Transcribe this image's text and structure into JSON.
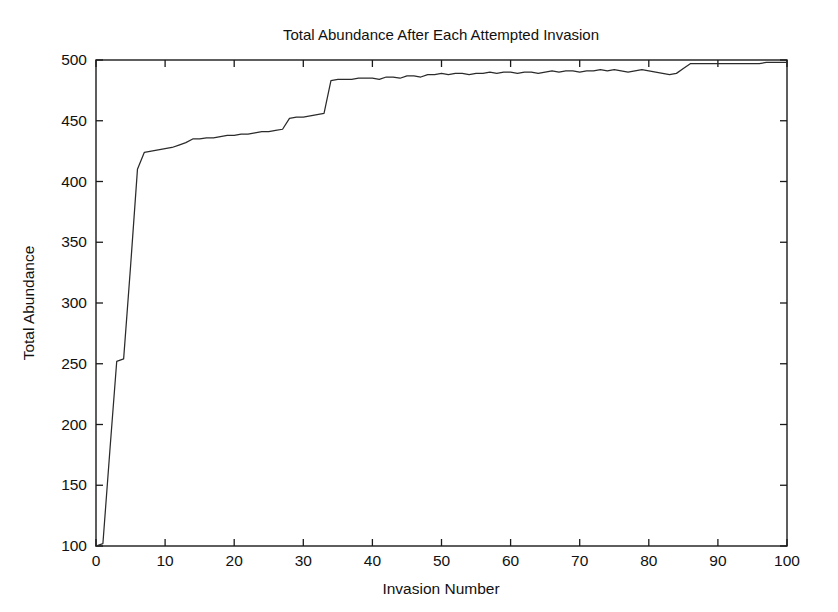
{
  "chart_data": {
    "type": "line",
    "title": "Total Abundance After Each Attempted Invasion",
    "xlabel": "Invasion Number",
    "ylabel": "Total Abundance",
    "xlim": [
      0,
      100
    ],
    "ylim": [
      100,
      500
    ],
    "xticks": [
      0,
      10,
      20,
      30,
      40,
      50,
      60,
      70,
      80,
      90,
      100
    ],
    "yticks": [
      100,
      150,
      200,
      250,
      300,
      350,
      400,
      450,
      500
    ],
    "grid": false,
    "legend": null,
    "line_color": "#2b2b2b",
    "background": "#ffffff",
    "series": [
      {
        "name": "Total Abundance",
        "x": [
          0,
          1,
          2,
          3,
          4,
          5,
          6,
          7,
          8,
          9,
          10,
          11,
          12,
          13,
          14,
          15,
          16,
          17,
          18,
          19,
          20,
          21,
          22,
          23,
          24,
          25,
          26,
          27,
          28,
          29,
          30,
          31,
          32,
          33,
          34,
          35,
          36,
          37,
          38,
          39,
          40,
          41,
          42,
          43,
          44,
          45,
          46,
          47,
          48,
          49,
          50,
          51,
          52,
          53,
          54,
          55,
          56,
          57,
          58,
          59,
          60,
          61,
          62,
          63,
          64,
          65,
          66,
          67,
          68,
          69,
          70,
          71,
          72,
          73,
          74,
          75,
          76,
          77,
          78,
          79,
          80,
          81,
          82,
          83,
          84,
          85,
          86,
          87,
          88,
          89,
          90,
          91,
          92,
          93,
          94,
          95,
          96,
          97,
          98,
          99,
          100
        ],
        "values": [
          100,
          102,
          178,
          252,
          254,
          330,
          410,
          424,
          425,
          426,
          427,
          428,
          430,
          432,
          435,
          435,
          436,
          436,
          437,
          438,
          438,
          439,
          439,
          440,
          441,
          441,
          442,
          443,
          452,
          453,
          453,
          454,
          455,
          456,
          483,
          484,
          484,
          484,
          485,
          485,
          485,
          484,
          486,
          486,
          485,
          487,
          487,
          486,
          488,
          488,
          489,
          488,
          489,
          489,
          488,
          489,
          489,
          490,
          489,
          490,
          490,
          489,
          490,
          490,
          489,
          490,
          491,
          490,
          491,
          491,
          490,
          491,
          491,
          492,
          491,
          492,
          491,
          490,
          491,
          492,
          491,
          490,
          489,
          488,
          489,
          493,
          497,
          497,
          497,
          497,
          497,
          497,
          497,
          497,
          497,
          497,
          497,
          498,
          498,
          498,
          498
        ]
      }
    ]
  },
  "figure": {
    "plot_left_px": 96,
    "plot_right_px": 787,
    "plot_top_px": 60,
    "plot_bottom_px": 546
  }
}
